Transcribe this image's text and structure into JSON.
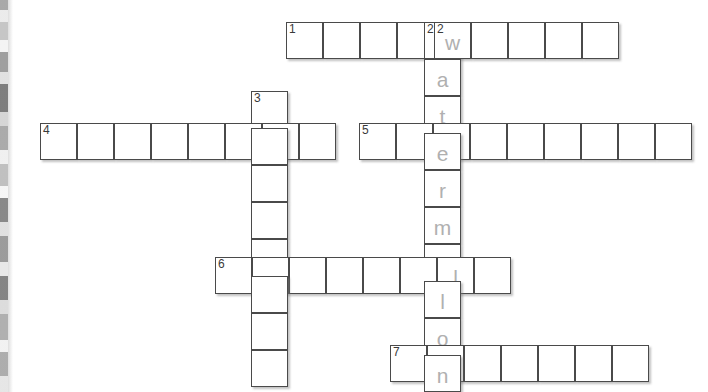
{
  "page": {
    "background_color": "#ffffff",
    "cell_size": 37,
    "cell_border_color": "#4a4a4a",
    "letter_color": "#b0b0b0",
    "number_color": "#3a3a3a"
  },
  "scan_artifact": {
    "name": "scanned-page-left-edge",
    "description": "vertical gray banding strip along the left margin"
  },
  "grid": {
    "entries": [
      {
        "id": "entry-1-across",
        "number": "1",
        "direction": "across",
        "length": 9,
        "x": 286,
        "y": 22,
        "letters": [
          "",
          "",
          "",
          "",
          "w",
          "",
          "",
          "",
          ""
        ],
        "numbers": [
          "1",
          "",
          "",
          "",
          "2",
          "",
          "",
          "",
          ""
        ]
      },
      {
        "id": "entry-2-down",
        "number": "2",
        "direction": "down",
        "length": 10,
        "x": 424,
        "y": 22,
        "answer": "watermelon",
        "letters": [
          "w",
          "a",
          "t",
          "e",
          "r",
          "m",
          "e",
          "l",
          "o",
          "n"
        ],
        "numbers": [
          "2",
          "",
          "",
          "",
          "",
          "",
          "",
          "",
          "",
          ""
        ]
      },
      {
        "id": "entry-3-down",
        "number": "3",
        "direction": "down",
        "length": 8,
        "x": 251,
        "y": 91,
        "letters": [
          "",
          "",
          "",
          "",
          "",
          "",
          "",
          ""
        ],
        "numbers": [
          "3",
          "",
          "",
          "",
          "",
          "",
          "",
          ""
        ]
      },
      {
        "id": "entry-4-across",
        "number": "4",
        "direction": "across",
        "length": 8,
        "x": 40,
        "y": 123,
        "letters": [
          "",
          "",
          "",
          "",
          "",
          "",
          "",
          ""
        ],
        "numbers": [
          "4",
          "",
          "",
          "",
          "",
          "",
          "",
          ""
        ]
      },
      {
        "id": "entry-5-across",
        "number": "5",
        "direction": "across",
        "length": 9,
        "x": 359,
        "y": 123,
        "letters": [
          "",
          "",
          "e",
          "",
          "",
          "",
          "",
          "",
          ""
        ],
        "numbers": [
          "5",
          "",
          "",
          "",
          "",
          "",
          "",
          "",
          ""
        ]
      },
      {
        "id": "entry-6-across",
        "number": "6",
        "direction": "across",
        "length": 8,
        "x": 215,
        "y": 257,
        "letters": [
          "",
          "",
          "",
          "",
          "",
          "",
          "l",
          ""
        ],
        "numbers": [
          "6",
          "",
          "",
          "",
          "",
          "",
          "",
          ""
        ]
      },
      {
        "id": "entry-7-across",
        "number": "7",
        "direction": "across",
        "length": 7,
        "x": 390,
        "y": 345,
        "letters": [
          "",
          "n",
          "",
          "",
          "",
          "",
          ""
        ],
        "numbers": [
          "7",
          "",
          "",
          "",
          "",
          "",
          ""
        ]
      }
    ]
  }
}
